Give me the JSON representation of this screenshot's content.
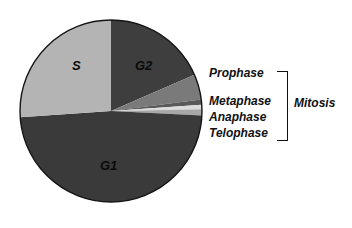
{
  "chart_data": {
    "type": "pie",
    "title": "",
    "center": [
      111,
      111
    ],
    "radius": 91,
    "start_angle_deg_from_top": 0,
    "direction": "clockwise",
    "slices": [
      {
        "name": "G2",
        "label": "G2",
        "percent": 18.5,
        "color": "#3e3e3e"
      },
      {
        "name": "Prophase",
        "label": "Prophase",
        "percent": 4.5,
        "color": "#7a7a7a"
      },
      {
        "name": "Metaphase",
        "label": "Metaphase",
        "percent": 0.9,
        "color": "#5a5a5a"
      },
      {
        "name": "Anaphase",
        "label": "Anaphase",
        "percent": 0.8,
        "color": "#dcdcdc"
      },
      {
        "name": "Telophase",
        "label": "Telophase",
        "percent": 1.1,
        "color": "#a8a8a8"
      },
      {
        "name": "G1",
        "label": "G1",
        "percent": 48.1,
        "color": "#3a3a3a"
      },
      {
        "name": "S",
        "label": "S",
        "percent": 26.1,
        "color": "#b4b4b4"
      }
    ],
    "group_annotation": {
      "label": "Mitosis",
      "members": [
        "Prophase",
        "Metaphase",
        "Anaphase",
        "Telophase"
      ]
    }
  },
  "labels": {
    "s": "S",
    "g2": "G2",
    "g1": "G1",
    "prophase": "Prophase",
    "metaphase": "Metaphase",
    "anaphase": "Anaphase",
    "telophase": "Telophase",
    "mitosis": "Mitosis"
  }
}
